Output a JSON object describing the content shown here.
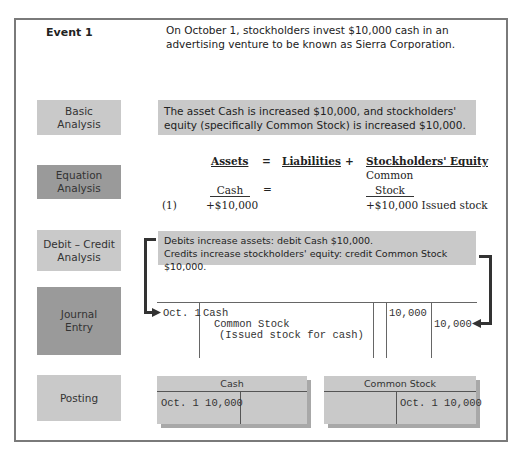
{
  "event": {
    "label": "Event 1",
    "text": "On October 1, stockholders invest $10,000 cash in an advertising venture to be known as Sierra Corporation."
  },
  "basic_analysis": {
    "label_line1": "Basic",
    "label_line2": "Analysis",
    "text": "The asset Cash is increased $10,000, and stockholders' equity (specifically Common Stock) is increased $10,000."
  },
  "equation_analysis": {
    "label_line1": "Equation",
    "label_line2": "Analysis",
    "headers": {
      "assets": "Assets",
      "equals": "=",
      "liabilities": "Liabilities",
      "plus": "+",
      "equity": "Stockholders' Equity"
    },
    "sub": {
      "cash": "Cash",
      "equals": "=",
      "common_line1": "Common",
      "common_line2": "Stock"
    },
    "row": {
      "number": "(1)",
      "cash_value": "+$10,000",
      "equity_value": "+$10,000 Issued stock"
    }
  },
  "debit_credit_analysis": {
    "label_line1": "Debit – Credit",
    "label_line2": "Analysis",
    "line1": "Debits increase assets: debit Cash $10,000.",
    "line2": "Credits increase stockholders' equity: credit Common Stock $10,000."
  },
  "journal_entry": {
    "label_line1": "Journal",
    "label_line2": "Entry",
    "date": "Oct. 1",
    "debit_account": "Cash",
    "credit_account": "Common Stock",
    "explanation": "(Issued stock for cash)",
    "debit_amount": "10,000",
    "credit_amount": "10,000"
  },
  "posting": {
    "label": "Posting",
    "accounts": [
      {
        "name": "Cash",
        "debit": "Oct. 1 10,000",
        "credit": ""
      },
      {
        "name": "Common Stock",
        "debit": "",
        "credit": "Oct. 1 10,000"
      }
    ]
  },
  "colors": {
    "light_box": "#c9c9c9",
    "dark_box": "#9a9a9a",
    "frame": "#7a7a7a"
  }
}
